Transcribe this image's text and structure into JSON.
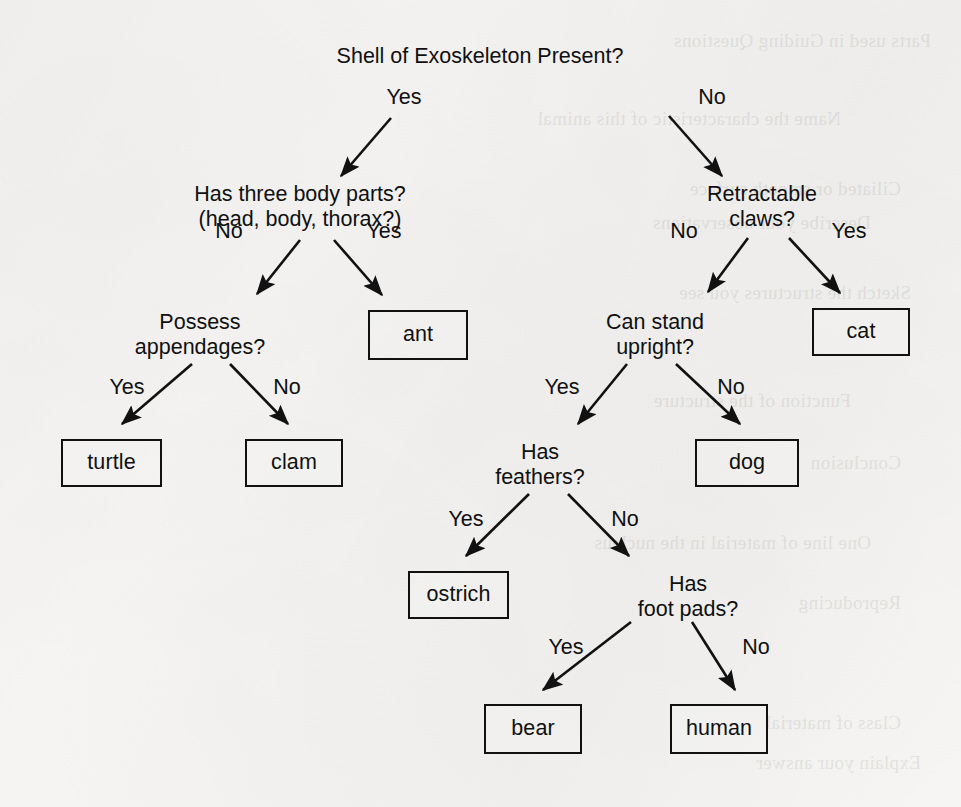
{
  "document": {
    "kind": "scanned-page-decision-tree",
    "background_color": "#f8f7f5",
    "ink_color": "#111111"
  },
  "diagram": {
    "type": "decision-tree",
    "root": "Shell of Exoskeleton Present?",
    "question_nodes": [
      {
        "id": "q-root",
        "lines": [
          "Shell of Exoskeleton Present?"
        ],
        "cx": 480,
        "y": 44
      },
      {
        "id": "q-bodyparts",
        "lines": [
          "Has three body parts?",
          "(head, body, thorax?)"
        ],
        "cx": 300,
        "y": 182
      },
      {
        "id": "q-claws",
        "lines": [
          "Retractable",
          "claws?"
        ],
        "cx": 762,
        "y": 182
      },
      {
        "id": "q-appendages",
        "lines": [
          "Possess",
          "appendages?"
        ],
        "cx": 200,
        "y": 310
      },
      {
        "id": "q-upright",
        "lines": [
          "Can stand",
          "upright?"
        ],
        "cx": 655,
        "y": 310
      },
      {
        "id": "q-feathers",
        "lines": [
          "Has",
          "feathers?"
        ],
        "cx": 540,
        "y": 440
      },
      {
        "id": "q-footpads",
        "lines": [
          "Has",
          "foot pads?"
        ],
        "cx": 688,
        "y": 572
      }
    ],
    "leaf_nodes": [
      {
        "id": "leaf-ant",
        "label": "ant",
        "x": 368,
        "y": 310,
        "w": 100,
        "h": 50
      },
      {
        "id": "leaf-cat",
        "label": "cat",
        "x": 812,
        "y": 308,
        "w": 98,
        "h": 48
      },
      {
        "id": "leaf-turtle",
        "label": "turtle",
        "x": 61,
        "y": 439,
        "w": 101,
        "h": 48
      },
      {
        "id": "leaf-clam",
        "label": "clam",
        "x": 245,
        "y": 439,
        "w": 98,
        "h": 48
      },
      {
        "id": "leaf-dog",
        "label": "dog",
        "x": 695,
        "y": 439,
        "w": 104,
        "h": 48
      },
      {
        "id": "leaf-ostrich",
        "label": "ostrich",
        "x": 408,
        "y": 571,
        "w": 101,
        "h": 48
      },
      {
        "id": "leaf-bear",
        "label": "bear",
        "x": 484,
        "y": 704,
        "w": 98,
        "h": 50
      },
      {
        "id": "leaf-human",
        "label": "human",
        "x": 670,
        "y": 704,
        "w": 98,
        "h": 50
      }
    ],
    "edges": [
      {
        "id": "e-root-yes",
        "label": "Yes",
        "from": "q-root",
        "to": "q-bodyparts",
        "lx": 404,
        "ly": 98,
        "x1": 391,
        "y1": 118,
        "x2": 341,
        "y2": 176
      },
      {
        "id": "e-root-no",
        "label": "No",
        "from": "q-root",
        "to": "q-claws",
        "lx": 712,
        "ly": 98,
        "x1": 669,
        "y1": 116,
        "x2": 722,
        "y2": 176
      },
      {
        "id": "e-bp-no",
        "label": "No",
        "from": "q-bodyparts",
        "to": "q-appendages",
        "lx": 229,
        "ly": 232,
        "x1": 300,
        "y1": 240,
        "x2": 257,
        "y2": 294
      },
      {
        "id": "e-bp-yes",
        "label": "Yes",
        "from": "q-bodyparts",
        "to": "leaf-ant",
        "lx": 384,
        "ly": 232,
        "x1": 334,
        "y1": 240,
        "x2": 382,
        "y2": 295
      },
      {
        "id": "e-claws-no",
        "label": "No",
        "from": "q-claws",
        "to": "q-upright",
        "lx": 684,
        "ly": 232,
        "x1": 748,
        "y1": 238,
        "x2": 708,
        "y2": 292
      },
      {
        "id": "e-claws-yes",
        "label": "Yes",
        "from": "q-claws",
        "to": "leaf-cat",
        "lx": 849,
        "ly": 232,
        "x1": 789,
        "y1": 238,
        "x2": 840,
        "y2": 293
      },
      {
        "id": "e-app-yes",
        "label": "Yes",
        "from": "q-appendages",
        "to": "leaf-turtle",
        "lx": 127,
        "ly": 388,
        "x1": 192,
        "y1": 364,
        "x2": 122,
        "y2": 424
      },
      {
        "id": "e-app-no",
        "label": "No",
        "from": "q-appendages",
        "to": "leaf-clam",
        "lx": 287,
        "ly": 388,
        "x1": 230,
        "y1": 364,
        "x2": 288,
        "y2": 424
      },
      {
        "id": "e-up-yes",
        "label": "Yes",
        "from": "q-upright",
        "to": "q-feathers",
        "lx": 562,
        "ly": 388,
        "x1": 627,
        "y1": 364,
        "x2": 578,
        "y2": 424
      },
      {
        "id": "e-up-no",
        "label": "No",
        "from": "q-upright",
        "to": "leaf-dog",
        "lx": 731,
        "ly": 388,
        "x1": 676,
        "y1": 364,
        "x2": 740,
        "y2": 424
      },
      {
        "id": "e-feat-yes",
        "label": "Yes",
        "from": "q-feathers",
        "to": "leaf-ostrich",
        "lx": 466,
        "ly": 520,
        "x1": 529,
        "y1": 494,
        "x2": 466,
        "y2": 556
      },
      {
        "id": "e-feat-no",
        "label": "No",
        "from": "q-feathers",
        "to": "q-footpads",
        "lx": 625,
        "ly": 520,
        "x1": 568,
        "y1": 494,
        "x2": 629,
        "y2": 556
      },
      {
        "id": "e-fp-yes",
        "label": "Yes",
        "from": "q-footpads",
        "to": "leaf-bear",
        "lx": 566,
        "ly": 648,
        "x1": 631,
        "y1": 622,
        "x2": 543,
        "y2": 690
      },
      {
        "id": "e-fp-no",
        "label": "No",
        "from": "q-footpads",
        "to": "leaf-human",
        "lx": 756,
        "ly": 648,
        "x1": 692,
        "y1": 622,
        "x2": 735,
        "y2": 690
      }
    ]
  },
  "bleed_through": [
    {
      "text": "Parts used in Guiding Questions",
      "x": 30,
      "y": 30
    },
    {
      "text": "Name the characteristic of this animal",
      "x": 120,
      "y": 108
    },
    {
      "text": "Ciliated or smooth surface",
      "x": 60,
      "y": 178
    },
    {
      "text": "Describe your observations",
      "x": 90,
      "y": 212
    },
    {
      "text": "Sketch the structures you see",
      "x": 50,
      "y": 282
    },
    {
      "text": "Function of the structure",
      "x": 110,
      "y": 390
    },
    {
      "text": "Conclusion",
      "x": 60,
      "y": 452
    },
    {
      "text": "One line of material in the nucleus",
      "x": 90,
      "y": 532
    },
    {
      "text": "Reproducing",
      "x": 60,
      "y": 592
    },
    {
      "text": "Class of material",
      "x": 60,
      "y": 712
    },
    {
      "text": "Explain your answer",
      "x": 40,
      "y": 752
    }
  ]
}
